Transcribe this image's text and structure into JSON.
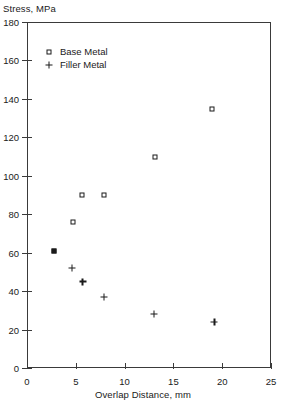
{
  "chart_data": {
    "type": "scatter",
    "title": "",
    "xlabel": "Overlap Distance, mm",
    "ylabel": "Stress, MPa",
    "xlim": [
      0,
      25
    ],
    "ylim": [
      0,
      180
    ],
    "xticks": [
      0,
      5,
      10,
      15,
      20,
      25
    ],
    "xtick_labels": [
      "0",
      "5",
      "10",
      "15",
      "20",
      "25"
    ],
    "yticks": [
      0,
      20,
      40,
      60,
      80,
      100,
      120,
      140,
      160,
      180
    ],
    "ytick_labels": [
      "0",
      "20",
      "40",
      "60",
      "80",
      "100",
      "120",
      "140",
      "160",
      "180"
    ],
    "grid": false,
    "legend_position": "upper left inside",
    "series": [
      {
        "name": "Base Metal",
        "marker": "square",
        "color": "#1a1a1a",
        "points": [
          {
            "x": 2.8,
            "y": 61,
            "filled": true
          },
          {
            "x": 4.7,
            "y": 76,
            "filled": false
          },
          {
            "x": 5.6,
            "y": 90,
            "filled": false
          },
          {
            "x": 7.9,
            "y": 90,
            "filled": false
          },
          {
            "x": 13.1,
            "y": 110,
            "filled": false
          },
          {
            "x": 19.0,
            "y": 135,
            "filled": false
          }
        ]
      },
      {
        "name": "Filler Metal",
        "marker": "plus",
        "color": "#1a1a1a",
        "points": [
          {
            "x": 4.6,
            "y": 52
          },
          {
            "x": 5.7,
            "y": 45
          },
          {
            "x": 7.9,
            "y": 37
          },
          {
            "x": 13.0,
            "y": 28
          },
          {
            "x": 19.2,
            "y": 24
          }
        ]
      }
    ]
  },
  "labels": {
    "y_axis_title": "Stress, MPa",
    "x_axis_title": "Overlap Distance, mm"
  },
  "legend": {
    "items": [
      {
        "label": "Base Metal",
        "marker": "square"
      },
      {
        "label": "Filler Metal",
        "marker": "plus"
      }
    ]
  }
}
